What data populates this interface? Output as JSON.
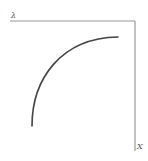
{
  "diagram": {
    "labels": {
      "top_axis": "λ",
      "right_axis": "X"
    },
    "colors": {
      "axis": "#9a9a9a",
      "curve": "#444444",
      "label": "#555555",
      "background": "#ffffff"
    },
    "axes": {
      "top": {
        "x1": 10,
        "y1": 21,
        "x2": 135,
        "y2": 21
      },
      "right": {
        "x1": 135,
        "y1": 21,
        "x2": 135,
        "y2": 151
      }
    },
    "curve": {
      "start": [
        32,
        126
      ],
      "control": [
        40,
        42
      ],
      "end": [
        118,
        37
      ]
    }
  }
}
